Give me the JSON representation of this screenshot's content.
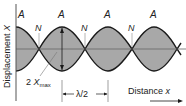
{
  "axes": {
    "y_label": "Displacement",
    "y_symbol": "X",
    "x_label": "Distance",
    "x_symbol": "x"
  },
  "labels": {
    "antinode": "A",
    "node": "N",
    "amplitude_prefix": "2 ",
    "amplitude_symbol": "X",
    "amplitude_sub": "max",
    "half_wavelength": "λ/2"
  },
  "colors": {
    "fill": "#a8a8a8",
    "stroke": "#1a1a1a",
    "axis": "#555555"
  },
  "geometry": {
    "center_y": 49,
    "amplitude_px": 22,
    "node_x": [
      39,
      85,
      132,
      177
    ],
    "antinode_x": [
      16,
      62,
      108,
      154
    ]
  }
}
